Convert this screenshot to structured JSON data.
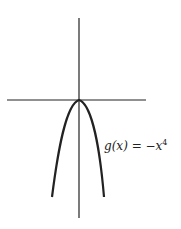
{
  "diagram": {
    "function_label": "g(x) = −x",
    "exponent": "4",
    "function": "g(x) = -x^4",
    "colors": {
      "stroke": "#222222",
      "background": "#ffffff"
    }
  }
}
